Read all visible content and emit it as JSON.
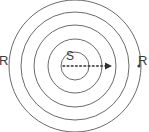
{
  "figure": {
    "background_color": "#ffffff",
    "stroke_color": "#6b6b6b",
    "text_color": "#3a3a3a",
    "width": 149,
    "height": 132
  },
  "labels": {
    "source": "S",
    "radius_left": "R",
    "radius_right": "R"
  },
  "geometry": {
    "center_x": 75,
    "center_y": 66,
    "circle_radii": [
      14,
      27,
      41,
      54,
      66
    ],
    "circle_count": 5,
    "arrow": {
      "from_x": 63,
      "to_x": 110,
      "y": 66,
      "style": "dotted",
      "head": "right"
    },
    "marker_dot": {
      "x": 139,
      "y": 66,
      "radius": 1.6
    }
  },
  "chart_data": {
    "type": "scatter",
    "categories": [
      "wavefront 1",
      "wavefront 2",
      "wavefront 3",
      "wavefront 4",
      "wavefront 5"
    ],
    "values": [
      14,
      27,
      41,
      54,
      66
    ],
    "xlabel": "",
    "ylabel": "radius R (px)",
    "annotations": [
      "S",
      "R",
      "R"
    ],
    "grid": false,
    "legend": "none"
  }
}
